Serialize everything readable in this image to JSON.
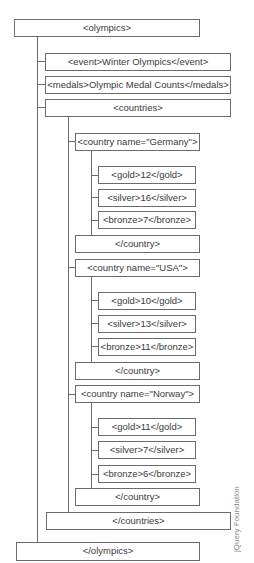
{
  "diagram": {
    "root_open": "<olympics>",
    "root_close": "</olympics>",
    "event": "<event>Winter Olympics</event>",
    "medals": "<medals>Olympic Medal Counts</medals>",
    "countries_open": "<countries>",
    "countries_close": "</countries>",
    "countries": [
      {
        "open": "<country name=\"Germany\">",
        "gold": "<gold>12</gold>",
        "silver": "<silver>16</silver>",
        "bronze": "<bronze>7</bronze>",
        "close": "</country>"
      },
      {
        "open": "<country name=\"USA\">",
        "gold": "<gold>10</gold>",
        "silver": "<silver>13</silver>",
        "bronze": "<bronze>11</bronze>",
        "close": "</country>"
      },
      {
        "open": "<country name=\"Norway\">",
        "gold": "<gold>11</gold>",
        "silver": "<silver>7</silver>",
        "bronze": "<bronze>6</bronze>",
        "close": "</country>"
      }
    ]
  },
  "credit": "jQuery Foundation",
  "colors": {
    "line": "#6b6b6b",
    "text": "#3a3a3a",
    "background": "#ffffff"
  }
}
